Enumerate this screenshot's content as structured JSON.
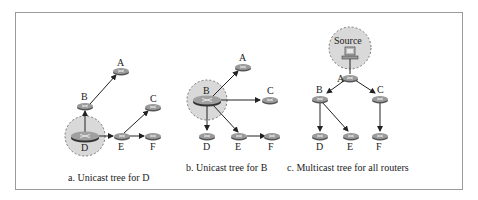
{
  "figure": {
    "panels": [
      {
        "id": "a",
        "caption": "a. Unicast tree for D",
        "root": "D",
        "nodes": {
          "A": "A",
          "B": "B",
          "C": "C",
          "D": "D",
          "E": "E",
          "F": "F"
        },
        "edges": [
          [
            "D",
            "B"
          ],
          [
            "B",
            "A"
          ],
          [
            "D",
            "E"
          ],
          [
            "E",
            "C"
          ],
          [
            "E",
            "F"
          ]
        ]
      },
      {
        "id": "b",
        "caption": "b. Unicast tree for B",
        "root": "B",
        "nodes": {
          "A": "A",
          "B": "B",
          "C": "C",
          "D": "D",
          "E": "E",
          "F": "F"
        },
        "edges": [
          [
            "B",
            "A"
          ],
          [
            "B",
            "C"
          ],
          [
            "B",
            "D"
          ],
          [
            "B",
            "E"
          ],
          [
            "E",
            "F"
          ]
        ]
      },
      {
        "id": "c",
        "caption": "c. Multicast tree for all routers",
        "root": "Source",
        "source_label": "Source",
        "nodes": {
          "A": "A",
          "B": "B",
          "C": "C",
          "D": "D",
          "E": "E",
          "F": "F"
        },
        "edges": [
          [
            "Source",
            "A"
          ],
          [
            "A",
            "B"
          ],
          [
            "A",
            "C"
          ],
          [
            "B",
            "D"
          ],
          [
            "B",
            "E"
          ],
          [
            "C",
            "F"
          ]
        ]
      }
    ],
    "colors": {
      "router": "#8a8a8a",
      "highlight": "#d6d6d6",
      "line": "#222222",
      "border": "#9a9a9a"
    }
  }
}
